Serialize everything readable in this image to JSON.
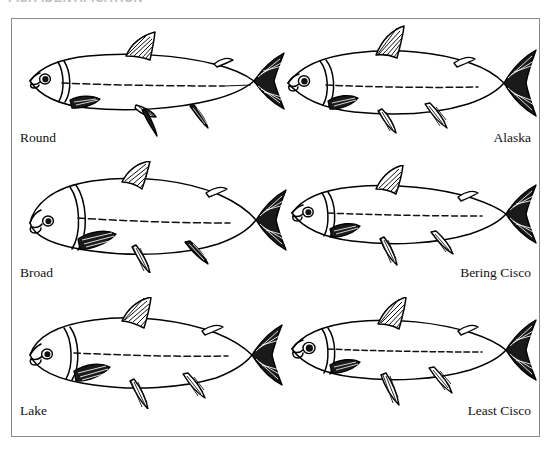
{
  "plate": {
    "top_caption": "FISH IDENTIFICATION",
    "border_color": "#8a8a8a",
    "ink_color": "#000000",
    "background_color": "#ffffff",
    "figure_type": "scientific line-drawing identification plate",
    "subject": "Whitefish and cisco species, lateral view line drawings",
    "rows": 3,
    "columns": 2
  },
  "species": [
    {
      "id": "round",
      "label": "Round",
      "row": 1,
      "column": "left",
      "label_align": "left",
      "body_shape": "slender elongate",
      "snout": "blunt overhanging snout",
      "notes": "dotted lateral line, hatched fins, forked caudal fin"
    },
    {
      "id": "alaska",
      "label": "Alaska",
      "row": 1,
      "column": "right",
      "label_align": "right",
      "body_shape": "moderately deep",
      "snout": "small blunt snout",
      "notes": "high dorsal fin, deeply forked caudal fin"
    },
    {
      "id": "broad",
      "label": "Broad",
      "row": 2,
      "column": "left",
      "label_align": "left",
      "body_shape": "deep robust body, humped back",
      "snout": "short rounded blunt snout",
      "notes": "deepest-bodied of the six, large rounded head"
    },
    {
      "id": "bering-cisco",
      "label": "Bering Cisco",
      "row": 2,
      "column": "right",
      "label_align": "right",
      "body_shape": "slender streamlined",
      "snout": "pointed terminal mouth",
      "notes": "dotted lateral line runs full body length"
    },
    {
      "id": "lake",
      "label": "Lake",
      "row": 3,
      "column": "left",
      "label_align": "left",
      "body_shape": "moderately deep, arched back",
      "snout": "blunt snout",
      "notes": "prominent hatched dorsal and caudal fins"
    },
    {
      "id": "least-cisco",
      "label": "Least Cisco",
      "row": 3,
      "column": "right",
      "label_align": "right",
      "body_shape": "slender, smallest",
      "snout": "upturned terminal mouth",
      "notes": "large eye, slim caudal peduncle"
    }
  ]
}
